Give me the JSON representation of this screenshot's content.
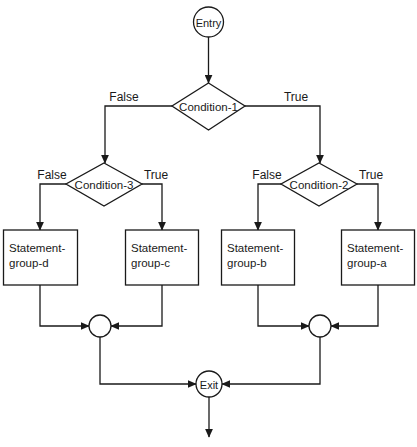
{
  "diagram": {
    "colors": {
      "stroke": "#1a1a1a",
      "fill": "#ffffff",
      "background": "#ffffff"
    },
    "entry": {
      "label": "Entry"
    },
    "exit": {
      "label": "Exit"
    },
    "decisions": [
      {
        "id": "condition-1",
        "label": "Condition-1",
        "false_label": "False",
        "true_label": "True"
      },
      {
        "id": "condition-3",
        "label": "Condition-3",
        "false_label": "False",
        "true_label": "True"
      },
      {
        "id": "condition-2",
        "label": "Condition-2",
        "false_label": "False",
        "true_label": "True"
      }
    ],
    "process_boxes": [
      {
        "id": "statement-group-d",
        "line1": "Statement-",
        "line2": "group-d"
      },
      {
        "id": "statement-group-c",
        "line1": "Statement-",
        "line2": "group-c"
      },
      {
        "id": "statement-group-b",
        "line1": "Statement-",
        "line2": "group-b"
      },
      {
        "id": "statement-group-a",
        "line1": "Statement-",
        "line2": "group-a"
      }
    ],
    "merge_nodes": [
      {
        "id": "merge-left",
        "label": ""
      },
      {
        "id": "merge-right",
        "label": ""
      }
    ]
  }
}
